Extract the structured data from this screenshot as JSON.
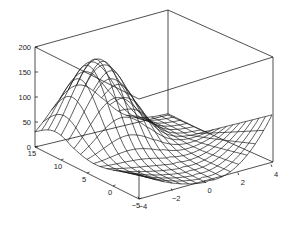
{
  "chart_data": {
    "type": "surface",
    "title": "",
    "xlabel": "",
    "ylabel": "",
    "zlabel": "",
    "x_range": [
      -4,
      4
    ],
    "y_range": [
      -5,
      15
    ],
    "z_range": [
      0,
      200
    ],
    "x_ticks": [
      "-4",
      "-2",
      "0",
      "2",
      "4"
    ],
    "y_ticks": [
      "-5",
      "0",
      "5",
      "10",
      "15"
    ],
    "z_ticks": [
      "0",
      "50",
      "100",
      "150",
      "200"
    ],
    "grid": false,
    "box": true,
    "mesh_color": "#1a1a1a",
    "background": "#ffffff"
  }
}
